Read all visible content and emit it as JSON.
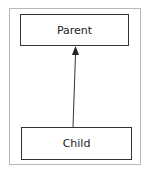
{
  "diagram": {
    "type": "class-inheritance",
    "nodes": [
      {
        "id": "parent",
        "label": "Parent"
      },
      {
        "id": "child",
        "label": "Child"
      }
    ],
    "edges": [
      {
        "from": "child",
        "to": "parent",
        "arrow": "filled-triangle"
      }
    ]
  }
}
